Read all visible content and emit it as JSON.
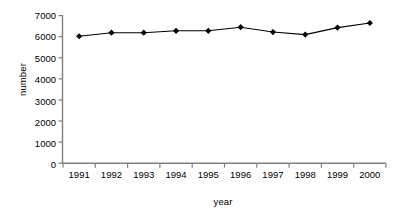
{
  "chart_data": {
    "type": "line",
    "title": "",
    "xlabel": "year",
    "ylabel": "number",
    "categories": [
      "1991",
      "1992",
      "1993",
      "1994",
      "1995",
      "1996",
      "1997",
      "1998",
      "1999",
      "2000"
    ],
    "values": [
      6020,
      6190,
      6190,
      6280,
      6280,
      6450,
      6220,
      6100,
      6430,
      6650
    ],
    "series": [
      {
        "name": "number",
        "values": [
          6020,
          6190,
          6190,
          6280,
          6280,
          6450,
          6220,
          6100,
          6430,
          6650
        ]
      }
    ],
    "ylim": [
      0,
      7000
    ],
    "yticks": [
      "0",
      "1000",
      "2000",
      "3000",
      "4000",
      "5000",
      "6000",
      "7000"
    ],
    "ytick_values": [
      0,
      1000,
      2000,
      3000,
      4000,
      5000,
      6000,
      7000
    ],
    "grid": false,
    "legend": "none",
    "marker": "diamond",
    "line_color": "#000000",
    "marker_color": "#000000",
    "axis_color": "#808080"
  },
  "axes": {
    "x_title": "year",
    "y_title": "number"
  }
}
